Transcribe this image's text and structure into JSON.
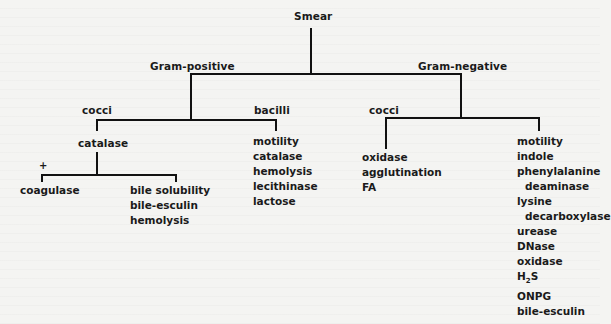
{
  "diagram": {
    "root": "Smear",
    "gram_positive": {
      "label": "Gram-positive",
      "cocci": {
        "label": "cocci",
        "test": "catalase",
        "positive_marker": "+",
        "positive_branch": [
          "coagulase"
        ],
        "negative_branch": [
          "bile solubility",
          "bile-esculin",
          "hemolysis"
        ]
      },
      "bacilli": {
        "label": "bacilli",
        "tests": [
          "motility",
          "catalase",
          "hemolysis",
          "lecithinase",
          "lactose"
        ]
      }
    },
    "gram_negative": {
      "label": "Gram-negative",
      "cocci": {
        "label": "cocci",
        "tests": [
          "oxidase",
          "agglutination",
          "FA"
        ]
      },
      "bacilli": {
        "tests": [
          "motility",
          "indole",
          "phenylalanine",
          "deaminase",
          "lysine",
          "decarboxylase",
          "urease",
          "DNase",
          "oxidase",
          "H",
          "ONPG",
          "bile-esculin"
        ],
        "h2s_sub": "2",
        "h2s_suffix": "S"
      }
    }
  }
}
